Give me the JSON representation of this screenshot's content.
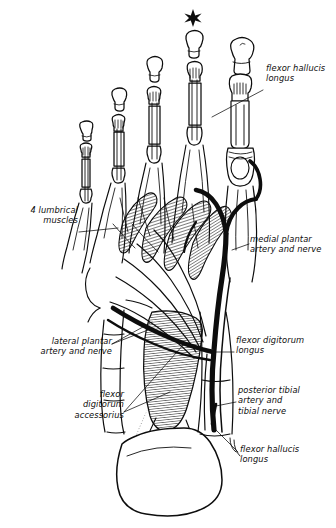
{
  "figure": {
    "view": "plantar (sole) view of right foot",
    "background_color": "#ffffff",
    "ink_color": "#0d0d0d",
    "width": 336,
    "height": 528
  },
  "markers": [
    {
      "name": "asterisk-marker",
      "glyph": "✸",
      "x": 193,
      "y": 18,
      "note": "asterisk above the second toe"
    }
  ],
  "labels": [
    {
      "id": "flexor-hallucis-longus-top",
      "text": "flexor hallucis\nlongus",
      "align": "left",
      "x": 266,
      "y": 68,
      "leader": {
        "from_x": 263,
        "from_y": 90,
        "to_x": 212,
        "to_y": 117
      }
    },
    {
      "id": "four-lumbrical-muscles",
      "text": "4 lumbrical\nmuscles",
      "align": "right",
      "x": 8,
      "y": 210,
      "leader": {
        "from_x": 79,
        "from_y": 232,
        "to_x": 116,
        "to_y": 228
      }
    },
    {
      "id": "medial-plantar-artery-and-nerve",
      "text": "medial plantar\nartery and nerve",
      "align": "left",
      "x": 250,
      "y": 238,
      "leader": {
        "from_x": 248,
        "from_y": 244,
        "to_x": 232,
        "to_y": 250
      }
    },
    {
      "id": "lateral-plantar-artery-and-nerve",
      "text": "lateral plantar\nartery and nerve",
      "align": "right",
      "x": 28,
      "y": 340,
      "leader": {
        "from_x": 112,
        "from_y": 344,
        "to_x": 152,
        "to_y": 322
      }
    },
    {
      "id": "flexor-digitorum-longus",
      "text": "flexor digitorum\nlongus",
      "align": "left",
      "x": 236,
      "y": 339,
      "leader": {
        "from_x": 234,
        "from_y": 352,
        "to_x": 207,
        "to_y": 352
      }
    },
    {
      "id": "posterior-tibial-artery-and-tibial-nerve",
      "text": "posterior tibial\nartery and\ntibial nerve",
      "align": "left",
      "x": 238,
      "y": 389,
      "leader": {
        "from_x": 236,
        "from_y": 402,
        "to_x": 218,
        "to_y": 406
      }
    },
    {
      "id": "flexor-digitorum-accessorius",
      "text": "flexor\ndigitorum\naccessorius",
      "align": "right",
      "x": 20,
      "y": 393,
      "leader": {
        "from_x": 124,
        "from_y": 412,
        "to_x": 182,
        "to_y": 344
      }
    },
    {
      "id": "flexor-hallucis-longus-bottom",
      "text": "flexor hallucis\nlongus",
      "align": "left",
      "x": 240,
      "y": 448,
      "leader": {
        "from_x": 238,
        "from_y": 452,
        "to_x": 215,
        "to_y": 428
      }
    }
  ],
  "structures": [
    {
      "name": "hallux",
      "description": "great toe with sesamoid bone"
    },
    {
      "name": "toes-2-5",
      "description": "lesser toes with phalanges and flexor tendons"
    },
    {
      "name": "lumbrical-muscles",
      "description": "four hatched fusiform muscles in mid-sole"
    },
    {
      "name": "flexor-digitorum-longus-tendon",
      "description": "long tendon splitting into four slips"
    },
    {
      "name": "flexor-digitorum-accessorius",
      "description": "quadratus plantae hatched muscle on calcaneus"
    },
    {
      "name": "neurovascular-bundle",
      "description": "heavy black artery and nerve trunk"
    },
    {
      "name": "calcaneus",
      "description": "rounded heel bone at base"
    }
  ]
}
